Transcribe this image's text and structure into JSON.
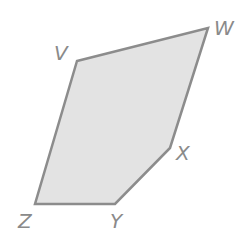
{
  "diagram": {
    "shape": "pentagon",
    "fill_color": "#e3e3e3",
    "stroke_color": "#8c8c8c",
    "vertices": [
      {
        "label": "V",
        "x": 77,
        "y": 61
      },
      {
        "label": "W",
        "x": 208,
        "y": 28
      },
      {
        "label": "X",
        "x": 170,
        "y": 148
      },
      {
        "label": "Y",
        "x": 115,
        "y": 204
      },
      {
        "label": "Z",
        "x": 35,
        "y": 204
      }
    ],
    "labels": {
      "V": "V",
      "W": "W",
      "X": "X",
      "Y": "Y",
      "Z": "Z"
    }
  }
}
